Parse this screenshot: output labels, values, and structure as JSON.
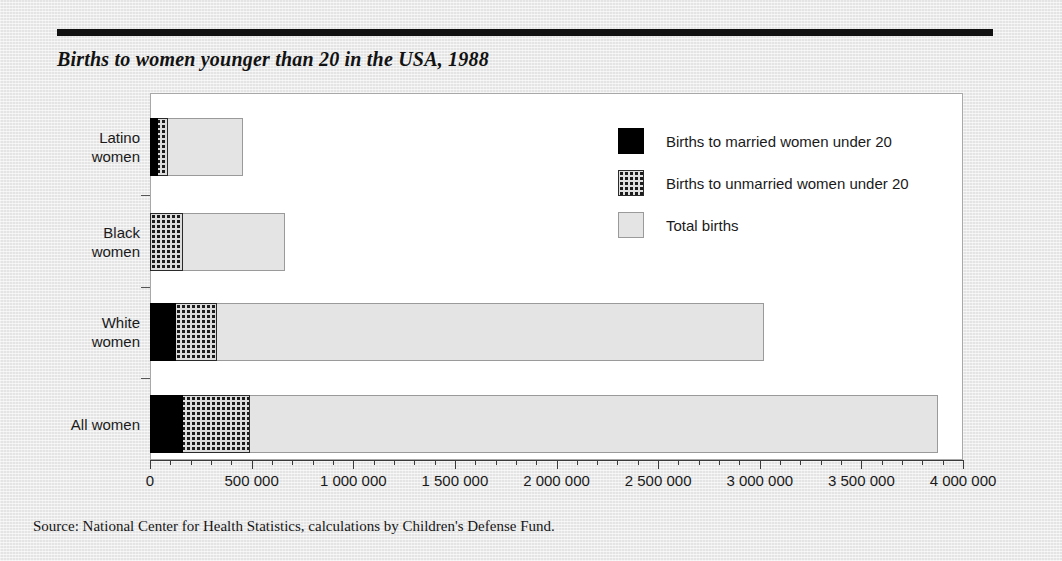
{
  "page": {
    "title": "Births to women younger than 20 in the USA, 1988",
    "source": "Source: National Center for Health Statistics, calculations by Children's Defense Fund."
  },
  "legend": {
    "items": [
      {
        "key": "married",
        "label": "Births to married women under 20",
        "swatch": "solid-black-swatch-icon"
      },
      {
        "key": "unmarried",
        "label": "Births to unmarried women under 20",
        "swatch": "stippled-swatch-icon"
      },
      {
        "key": "total",
        "label": "Total births",
        "swatch": "light-gray-swatch-icon"
      }
    ]
  },
  "axis": {
    "ticks": [
      {
        "value": 0,
        "label": "0"
      },
      {
        "value": 500000,
        "label": "500 000"
      },
      {
        "value": 1000000,
        "label": "1 000 000"
      },
      {
        "value": 1500000,
        "label": "1 500 000"
      },
      {
        "value": 2000000,
        "label": "2 000 000"
      },
      {
        "value": 2500000,
        "label": "2 500 000"
      },
      {
        "value": 3000000,
        "label": "3 000 000"
      },
      {
        "value": 3500000,
        "label": "3 500 000"
      },
      {
        "value": 4000000,
        "label": "4 000 000"
      }
    ],
    "minor_step": 100000
  },
  "chart_data": {
    "type": "bar",
    "orientation": "horizontal",
    "overlap": "overlaid",
    "title": "Births to women younger than 20 in the USA, 1988",
    "xlabel": "",
    "ylabel": "",
    "xlim": [
      0,
      4000000
    ],
    "grid": false,
    "legend_position": "inside-top-right",
    "categories": [
      "Latino women",
      "Black women",
      "White women",
      "All women"
    ],
    "category_lines": [
      [
        "Latino",
        "women"
      ],
      [
        "Black",
        "women"
      ],
      [
        "White",
        "women"
      ],
      [
        "All women"
      ]
    ],
    "series": [
      {
        "name": "Total births",
        "key": "total",
        "values": [
          460000,
          665000,
          3020000,
          3875000
        ]
      },
      {
        "name": "Births to unmarried women under 20",
        "key": "unmarried",
        "values": [
          87000,
          160000,
          330000,
          490000
        ]
      },
      {
        "name": "Births to married women under 20",
        "key": "married",
        "values": [
          40000,
          0,
          130000,
          160000
        ]
      }
    ]
  },
  "colors": {
    "married": "#000000",
    "unmarried_fill": "#dcdcdc",
    "unmarried_dot": "#1c1c1c",
    "total": "#e4e4e4",
    "total_border": "#9a9a9a",
    "page_background": "#ebebeb",
    "plot_background": "#ffffff",
    "rule": "#111111"
  }
}
